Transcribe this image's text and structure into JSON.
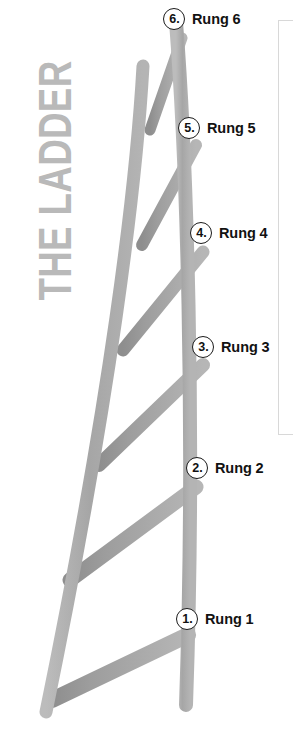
{
  "title": {
    "text": "THE LADDER",
    "color": "#b9b9b9",
    "orientation": "rotated-90-ccw"
  },
  "colors": {
    "rail": "#a9a9a9",
    "rung": "#b0b0b0",
    "rung_shadow": "#8e8e8e",
    "marker_border": "#1b1b1b",
    "label_text": "#121212",
    "panel_border": "#d8d8d8",
    "background": "#ffffff"
  },
  "diagram": {
    "name": "ladder-diagram",
    "rung_count": 6
  },
  "rungs": [
    {
      "marker": "6.",
      "label": "Rung 6",
      "left": 163,
      "top": 8
    },
    {
      "marker": "5.",
      "label": "Rung 5",
      "left": 178,
      "top": 117
    },
    {
      "marker": "4.",
      "label": "Rung 4",
      "left": 190,
      "top": 222
    },
    {
      "marker": "3.",
      "label": "Rung 3",
      "left": 192,
      "top": 336
    },
    {
      "marker": "2.",
      "label": "Rung 2",
      "left": 186,
      "top": 457
    },
    {
      "marker": "1.",
      "label": "Rung 1",
      "left": 176,
      "top": 608
    }
  ],
  "side_panel": {
    "name": "side-panel",
    "border_color": "#d8d8d8"
  }
}
